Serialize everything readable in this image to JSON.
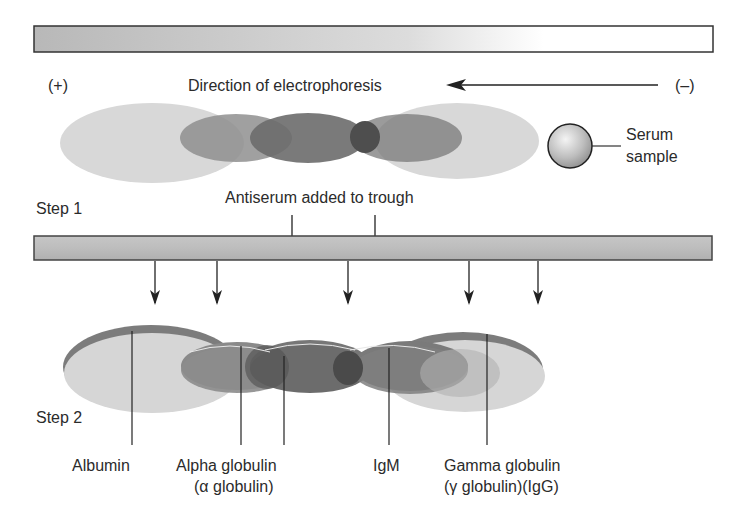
{
  "step1": {
    "label": "Step 1",
    "anode_label": "(+)",
    "cathode_label": "(–)",
    "direction_label": "Direction of electrophoresis",
    "serum_label_line1": "Serum",
    "serum_label_line2": "sample"
  },
  "trough": {
    "antiserum_label": "Antiserum added to trough"
  },
  "step2": {
    "label": "Step 2",
    "bands": [
      {
        "name": "Albumin",
        "line1": "Albumin",
        "line2": ""
      },
      {
        "name": "Alpha globulin",
        "line1": "Alpha globulin",
        "line2": "(α globulin)"
      },
      {
        "name": "IgM",
        "line1": "IgM",
        "line2": ""
      },
      {
        "name": "Gamma globulin",
        "line1": "Gamma globulin",
        "line2": "(γ globulin)(IgG)"
      }
    ]
  },
  "colors": {
    "light_band": "#d4d4d4",
    "mid_band": "#8a8a8a",
    "dark_band": "#6a6a6a",
    "darkest_overlap": "#4a4a4a",
    "precipitin_arc": "#7a7a7a",
    "trough_fill": "#bdbdbd",
    "line": "#222222"
  }
}
